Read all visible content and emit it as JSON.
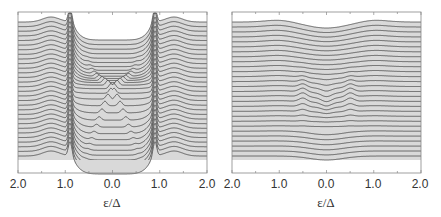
{
  "chart_data": [
    {
      "type": "line",
      "title": "",
      "xlabel": "ε/Δ",
      "ylabel": "",
      "xlim": [
        -2.0,
        2.0
      ],
      "x_tick_labels": [
        "2.0",
        "1.0",
        "0.0",
        "1.0",
        "2.0"
      ],
      "x_tick_values": [
        -2.0,
        -1.0,
        0.0,
        1.0,
        2.0
      ],
      "grid": false,
      "legend": null,
      "description": "Waterfall of stacked spectra (density of states vs energy); curves vertically offset, filled gray beneath each; sharp coherence peaks near ±0.9, gap region widening then closing with crossing Andreev-like bound states near center",
      "n_curves": 30,
      "features": {
        "coherence_peak_pos": 0.9,
        "gap_edge": 0.85,
        "bound_state_max": 0.6
      }
    },
    {
      "type": "line",
      "title": "",
      "xlabel": "ε/Δ",
      "ylabel": "",
      "xlim": [
        -2.0,
        2.0
      ],
      "x_tick_labels": [
        "2.0",
        "1.0",
        "0.0",
        "1.0",
        "2.0"
      ],
      "x_tick_values": [
        -2.0,
        -1.0,
        0.0,
        1.0,
        2.0
      ],
      "grid": false,
      "legend": null,
      "description": "Waterfall of stacked spectra, weakly featured; shallow dip centered at 0 in top curves, small bound-state features near ±0.5 in middle curves",
      "n_curves": 28,
      "features": {
        "dip_width": 1.0,
        "bound_state_pos": 0.5
      }
    }
  ],
  "panels": [
    {
      "xlabel": "ε/Δ",
      "ticks": [
        "2.0",
        "1.0",
        "0.0",
        "1.0",
        "2.0"
      ]
    },
    {
      "xlabel": "ε/Δ",
      "ticks": [
        "2.0",
        "1.0",
        "0.0",
        "1.0",
        "2.0"
      ]
    }
  ],
  "colors": {
    "fill": "#d9d9d9",
    "line": "#444444",
    "frame": "#888888"
  }
}
